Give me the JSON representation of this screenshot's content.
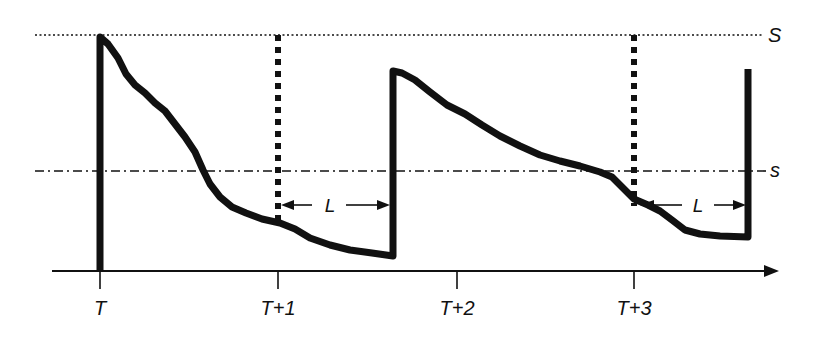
{
  "diagram": {
    "type": "inventory-review-policy",
    "colors": {
      "ink": "#111111",
      "background": "#ffffff"
    },
    "levels": {
      "upper": {
        "label": "S",
        "y": 35,
        "style": "dotted"
      },
      "lower": {
        "label": "s",
        "y": 171,
        "style": "dash-dot"
      }
    },
    "axis": {
      "y": 271,
      "x_start": 52,
      "x_end": 778,
      "ticks": [
        {
          "label": "T",
          "x": 100
        },
        {
          "label": "T+1",
          "x": 278
        },
        {
          "label": "T+2",
          "x": 457
        },
        {
          "label": "T+3",
          "x": 634
        }
      ]
    },
    "review_markers": [
      {
        "x": 278,
        "y_top": 35,
        "y_bottom": 218
      },
      {
        "x": 634,
        "y_top": 35,
        "y_bottom": 205
      }
    ],
    "lead_time_arrows": [
      {
        "label": "L",
        "x_start": 281,
        "x_end": 390,
        "y": 205
      },
      {
        "label": "L",
        "x_start": 640,
        "x_end": 746,
        "y": 205
      }
    ],
    "inventory_path": "M100,271 L100,37 L108,44 L118,58 L126,74 L135,85 L145,93 L155,103 L165,111 L175,124 L185,137 L195,152 L203,170 L210,184 L220,197 L232,207 L246,213 L262,219 L280,223 L295,229 L310,238 L330,245 L350,250 L372,253 L393,256 L393,71 L402,73 L415,80 L430,92 L447,105 L465,114 L482,125 L500,136 L520,146 L540,155 L560,161 L580,166 L600,172 L612,177 L622,187 L634,199 L648,205 L660,211 L672,220 L685,230 L700,234 L720,236 L748,237 L748,69"
  }
}
